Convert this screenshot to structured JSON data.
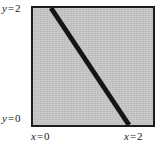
{
  "figure": {
    "labels": {
      "y_top": {
        "var": "y",
        "eq": "=",
        "value": "2"
      },
      "y_bottom": {
        "var": "y",
        "eq": "=",
        "value": "0"
      },
      "x_left": {
        "var": "x",
        "eq": "=",
        "value": "0"
      },
      "x_right": {
        "var": "x",
        "eq": "=",
        "value": "2"
      }
    },
    "colors": {
      "plot_background": "#c6c6c6",
      "frame_border": "#1c1c1c",
      "line": "#151515",
      "page_background": "#ffffff",
      "label_text": "#1a1a1a"
    }
  },
  "chart_data": {
    "type": "line",
    "title": "",
    "xlabel": "x",
    "ylabel": "y",
    "xlim": [
      0,
      2
    ],
    "ylim": [
      0,
      2
    ],
    "xticks": [
      0,
      2
    ],
    "yticks": [
      0,
      2
    ],
    "xticklabels": [
      "x = 0",
      "x = 2"
    ],
    "yticklabels": [
      "y = 0",
      "y = 2"
    ],
    "grid": false,
    "legend": null,
    "background": "shaded gray square region over 0 <= x <= 2, 0 <= y <= 2",
    "series": [
      {
        "name": "thick diagonal line",
        "style": "solid",
        "linewidth_px": 5,
        "color": "#151515",
        "comment": "straight line crossing the square from the top edge to the bottom edge with positive slope in data coordinates",
        "x": [
          0.3,
          1.6
        ],
        "y": [
          2.0,
          0.0
        ],
        "endpoints_data": [
          [
            0.3,
            2.0
          ],
          [
            1.6,
            0.0
          ]
        ],
        "slope": -1.538,
        "intercept": 2.462
      }
    ]
  }
}
